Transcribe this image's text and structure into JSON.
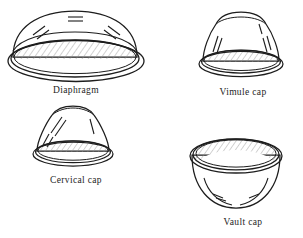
{
  "page": {
    "background_color": "#ffffff",
    "ink_color": "#1d1d1d",
    "hatch_color": "#8a8a8a",
    "width": 303,
    "height": 238
  },
  "figures": [
    {
      "id": "diaphragm",
      "label": "Diaphragm",
      "shape": "wide shallow dome with double-line rim ellipse and hatched inner cavity",
      "position": "top-left"
    },
    {
      "id": "vimule-cap",
      "label": "Vimule cap",
      "shape": "bell shaped cap with rounded crown, flared skirt, double rim and hatched inner cavity",
      "position": "top-right"
    },
    {
      "id": "cervical-cap",
      "label": "Cervical cap",
      "shape": "tall bell shaped cap with rounded crown, flared rim and hatched inner cavity",
      "position": "bottom-left"
    },
    {
      "id": "vault-cap",
      "label": "Vault cap",
      "shape": "hemispherical bowl seen from above with wide double rim and hatched inner bowl",
      "position": "bottom-right"
    }
  ]
}
